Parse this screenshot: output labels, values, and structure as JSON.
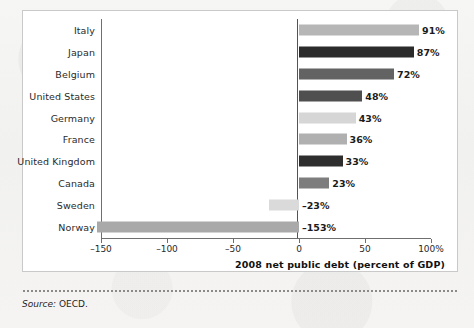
{
  "figure": {
    "axis_title": "2008 net public debt (percent of GDP)",
    "source_word": "Source:",
    "source_value": "OECD."
  },
  "chart_data": {
    "type": "bar",
    "orientation": "horizontal",
    "title": "",
    "subtitle": "",
    "xlabel": "2008 net public debt (percent of GDP)",
    "ylabel": "",
    "xlim": [
      -150,
      100
    ],
    "grid": false,
    "legend": "none",
    "xticks": [
      -150,
      -100,
      -50,
      0,
      50,
      100
    ],
    "xtick_labels": [
      "–150",
      "–100",
      "–50",
      "0",
      "50",
      "100%"
    ],
    "categories": [
      "Italy",
      "Japan",
      "Belgium",
      "United States",
      "Germany",
      "France",
      "United Kingdom",
      "Canada",
      "Sweden",
      "Norway"
    ],
    "values": [
      91,
      87,
      72,
      48,
      43,
      36,
      33,
      23,
      -23,
      -153
    ],
    "data_labels": [
      "91%",
      "87%",
      "72%",
      "48%",
      "43%",
      "36%",
      "33%",
      "23%",
      "–23%",
      "–153%"
    ],
    "bar_colors": [
      "#b6b6b6",
      "#2b2b2b",
      "#636363",
      "#4f4f4f",
      "#d6d6d6",
      "#b0b0b0",
      "#2e2e2e",
      "#7d7d7d",
      "#dadada",
      "#a9a9a9"
    ]
  }
}
